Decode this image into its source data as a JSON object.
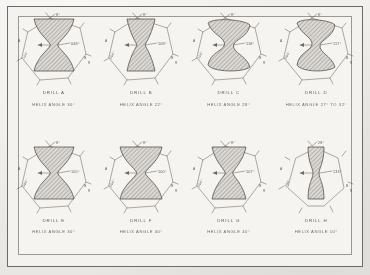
{
  "plate": {
    "background_color": "#efedea",
    "ink_color": "#47443f",
    "hatch_color": "#8e8b86",
    "frame_color": "#6d6a66"
  },
  "figures": [
    {
      "id": "drill-a",
      "drill_label": "DRILL A",
      "helix_label": "HELIX ANGLE 30°",
      "center_angle": "048°",
      "top_callout": "8°",
      "left_callout": "A",
      "left_dim": ".100\"",
      "right_callout": "B",
      "right_dim": "R",
      "web_style": "wide-hourglass",
      "web_waist": 7,
      "web_top_width": 40,
      "web_bottom_width": 40,
      "row": 1,
      "col": 1
    },
    {
      "id": "drill-b",
      "drill_label": "DRILL B",
      "helix_label": "HELIX ANGLE 22°",
      "center_angle": "108°",
      "top_callout": "8°",
      "left_callout": "A",
      "left_dim": ".090\"",
      "right_callout": "B",
      "right_dim": "R",
      "web_style": "narrow-hourglass",
      "web_waist": 8,
      "web_top_width": 28,
      "web_bottom_width": 28,
      "row": 1,
      "col": 2
    },
    {
      "id": "drill-c",
      "drill_label": "DRILL C",
      "helix_label": "HELIX ANGLE 28°",
      "center_angle": "118°",
      "top_callout": "8°",
      "left_callout": "A",
      "left_dim": ".100\"",
      "right_callout": "B",
      "right_dim": "R",
      "web_style": "s-curve",
      "web_waist": 9,
      "web_top_width": 42,
      "web_bottom_width": 42,
      "row": 1,
      "col": 3
    },
    {
      "id": "drill-d",
      "drill_label": "DRILL D",
      "helix_label": "HELIX ANGLE 27° TO 32°",
      "center_angle": "117°",
      "top_callout": "8°",
      "left_callout": "A",
      "left_dim": ".090\"",
      "right_callout": "B",
      "right_dim": "R",
      "web_style": "s-curve",
      "web_waist": 8,
      "web_top_width": 38,
      "web_bottom_width": 38,
      "row": 1,
      "col": 4
    },
    {
      "id": "drill-e",
      "drill_label": "DRILL E",
      "helix_label": "HELIX ANGLE 30°",
      "center_angle": "105°",
      "top_callout": "8°",
      "left_callout": "A",
      "left_dim": ".080\"",
      "right_callout": "B",
      "right_dim": "R",
      "web_style": "wide-hourglass",
      "web_waist": 7,
      "web_top_width": 40,
      "web_bottom_width": 40,
      "row": 2,
      "col": 1
    },
    {
      "id": "drill-f",
      "drill_label": "DRILL F",
      "helix_label": "HELIX ANGLE 40°",
      "center_angle": "100°",
      "top_callout": "8°",
      "left_callout": "A",
      "left_dim": ".090\"",
      "right_callout": "B",
      "right_dim": "R",
      "web_style": "wide-hourglass",
      "web_waist": 8,
      "web_top_width": 42,
      "web_bottom_width": 42,
      "row": 2,
      "col": 2
    },
    {
      "id": "drill-g",
      "drill_label": "DRILL G",
      "helix_label": "HELIX ANGLE 40°",
      "center_angle": "107°",
      "top_callout": "8°",
      "left_callout": "A",
      "left_dim": ".090\"",
      "right_callout": "B",
      "right_dim": "R",
      "web_style": "narrow-hourglass",
      "web_waist": 7,
      "web_top_width": 34,
      "web_bottom_width": 34,
      "row": 2,
      "col": 3
    },
    {
      "id": "drill-h",
      "drill_label": "DRILL H",
      "helix_label": "HELIX ANGLE 10°",
      "center_angle": "133°",
      "top_callout": "28°",
      "left_callout": "A",
      "left_dim": ".060\"",
      "right_callout": "B",
      "right_dim": "R",
      "web_style": "slender",
      "web_waist": 6,
      "web_top_width": 16,
      "web_bottom_width": 16,
      "row": 2,
      "col": 4
    }
  ]
}
